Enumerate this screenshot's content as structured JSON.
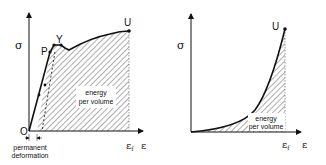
{
  "diagrams": [
    {
      "name": "ductile",
      "y_axis_label": "σ",
      "x_axis_label": "ε",
      "x_fracture_label": "ε",
      "x_fracture_sub": "f",
      "origin_label": "O",
      "points": {
        "P": "P",
        "Y": "Y",
        "U": "U"
      },
      "area_label_line1": "energy",
      "area_label_line2": "per volume",
      "note_line1": "permanent",
      "note_line2": "deformation"
    },
    {
      "name": "brittle",
      "y_axis_label": "σ",
      "x_axis_label": "ε",
      "x_fracture_label": "ε",
      "x_fracture_sub": "f",
      "points": {
        "U": "U"
      },
      "area_label_line1": "energy",
      "area_label_line2": "per volume"
    }
  ]
}
